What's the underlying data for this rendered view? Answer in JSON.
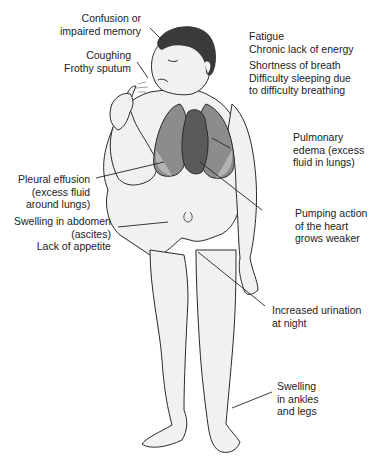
{
  "diagram": {
    "colors": {
      "skin": "#f1f1f1",
      "outline": "#2a2a2a",
      "hair": "#3a3a3a",
      "lung": "#8c8c8c",
      "lung_fluid": "#b4b4b4",
      "heart": "#5a5a5a",
      "leader": "#222222"
    },
    "labels": {
      "confusion": [
        "Confusion or",
        "impaired memory"
      ],
      "coughing": [
        "Coughing",
        "Frothy sputum"
      ],
      "fatigue": [
        "Fatigue",
        "Chronic lack of energy"
      ],
      "breath": [
        "Shortness of breath",
        "Difficulty sleeping due",
        "to difficulty breathing"
      ],
      "pulmonary_edema": [
        "Pulmonary",
        "edema (excess",
        "fluid in lungs)"
      ],
      "pleural_effusion": [
        "Pleural effusion",
        "(excess fluid",
        "around lungs)"
      ],
      "pumping": [
        "Pumping action",
        "of the heart",
        "grows weaker"
      ],
      "abdomen": [
        "Swelling in abdomen",
        "(ascites)",
        "Lack of appetite"
      ],
      "urination": [
        "Increased urination",
        "at night"
      ],
      "ankles": [
        "Swelling",
        "in ankles",
        "and legs"
      ]
    }
  }
}
